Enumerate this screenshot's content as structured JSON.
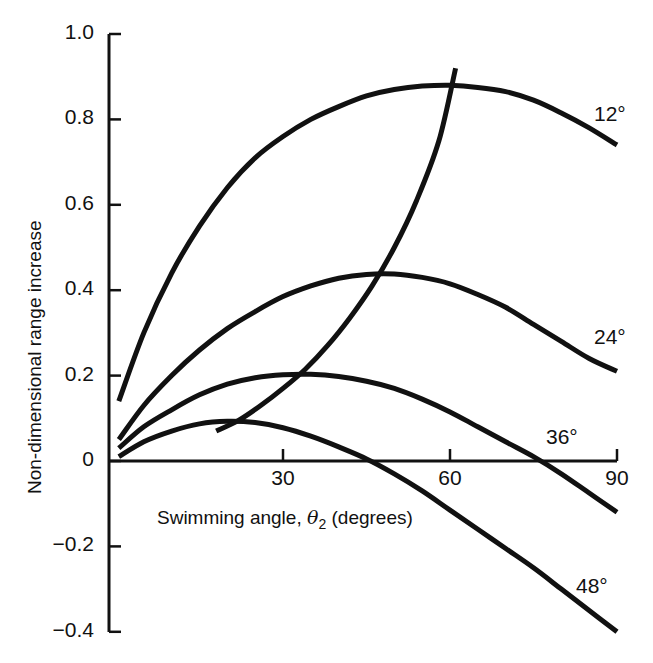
{
  "chart_data": {
    "type": "line",
    "title": "",
    "xlabel": "Swimming angle, θ2 (degrees)",
    "xlabel_parts": {
      "prefix": "Swimming angle, ",
      "symbol": "θ",
      "subscript": "2",
      "suffix": " (degrees)"
    },
    "ylabel": "Non-dimensional range increase",
    "xlim": [
      0,
      90
    ],
    "ylim": [
      -0.4,
      1.0
    ],
    "x_ticks": [
      30,
      60,
      90
    ],
    "x_tick_labels": [
      "30",
      "60",
      "90"
    ],
    "y_ticks": [
      1.0,
      0.8,
      0.6,
      0.4,
      0.2,
      0,
      -0.2,
      -0.4
    ],
    "y_tick_labels": [
      "1.0",
      "0.8",
      "0.6",
      "0.4",
      "0.2",
      "0",
      "−0.2",
      "−0.4"
    ],
    "grid": false,
    "legend": "inline curve labels at right end",
    "series": [
      {
        "name": "12°",
        "label": "12°",
        "x": [
          0.5,
          5,
          10,
          15,
          20,
          25,
          30,
          35,
          40,
          45,
          50,
          55,
          60,
          65,
          70,
          75,
          80,
          85,
          90
        ],
        "y": [
          0.14,
          0.3,
          0.44,
          0.55,
          0.64,
          0.71,
          0.76,
          0.8,
          0.83,
          0.855,
          0.87,
          0.878,
          0.88,
          0.875,
          0.865,
          0.845,
          0.815,
          0.78,
          0.74
        ]
      },
      {
        "name": "24°",
        "label": "24°",
        "x": [
          0.5,
          5,
          10,
          15,
          20,
          25,
          30,
          35,
          40,
          45,
          50,
          55,
          60,
          65,
          70,
          75,
          80,
          85,
          90
        ],
        "y": [
          0.05,
          0.13,
          0.2,
          0.26,
          0.31,
          0.35,
          0.385,
          0.41,
          0.428,
          0.437,
          0.438,
          0.43,
          0.415,
          0.39,
          0.36,
          0.32,
          0.28,
          0.24,
          0.21
        ]
      },
      {
        "name": "36°",
        "label": "36°",
        "x": [
          0.5,
          5,
          10,
          15,
          20,
          25,
          30,
          35,
          40,
          45,
          50,
          55,
          60,
          65,
          70,
          75,
          80,
          85,
          90
        ],
        "y": [
          0.03,
          0.08,
          0.12,
          0.155,
          0.18,
          0.195,
          0.202,
          0.203,
          0.198,
          0.187,
          0.17,
          0.145,
          0.115,
          0.08,
          0.045,
          0.01,
          -0.03,
          -0.075,
          -0.12
        ]
      },
      {
        "name": "48°",
        "label": "48°",
        "x": [
          0.5,
          5,
          10,
          15,
          20,
          25,
          30,
          35,
          40,
          45,
          50,
          55,
          60,
          65,
          70,
          75,
          80,
          85,
          90
        ],
        "y": [
          0.01,
          0.045,
          0.07,
          0.087,
          0.093,
          0.09,
          0.078,
          0.058,
          0.033,
          0.005,
          -0.03,
          -0.07,
          -0.115,
          -0.16,
          -0.205,
          -0.25,
          -0.3,
          -0.35,
          -0.4
        ]
      },
      {
        "name": "Optimum locus",
        "label": "",
        "x": [
          18,
          22,
          26,
          30,
          34,
          38,
          42,
          46,
          50,
          54,
          58,
          61
        ],
        "y": [
          0.07,
          0.095,
          0.13,
          0.17,
          0.215,
          0.27,
          0.335,
          0.41,
          0.5,
          0.61,
          0.75,
          0.92
        ]
      }
    ]
  },
  "axes": {
    "x_tick_labels": [
      "30",
      "60",
      "90"
    ],
    "y_tick_labels": [
      "1.0",
      "0.8",
      "0.6",
      "0.4",
      "0.2",
      "0",
      "−0.2",
      "−0.4"
    ]
  },
  "labels": {
    "curve_12": "12°",
    "curve_24": "24°",
    "curve_36": "36°",
    "curve_48": "48°",
    "xlabel_prefix": "Swimming angle, ",
    "xlabel_symbol": "θ",
    "xlabel_subscript": "2",
    "xlabel_suffix": " (degrees)",
    "ylabel": "Non-dimensional range increase"
  },
  "colors": {
    "ink": "#111111",
    "background": "#ffffff"
  }
}
